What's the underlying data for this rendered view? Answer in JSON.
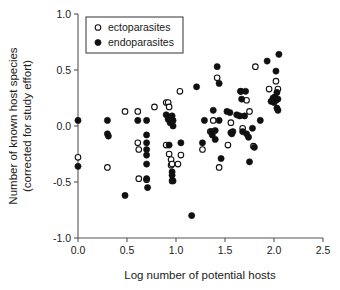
{
  "figure": {
    "background_color": "#ffffff",
    "axis_color": "#555555",
    "marker_color": "#101010"
  },
  "chart_data": {
    "type": "scatter",
    "title": "",
    "xlabel": "Log number of potential hosts",
    "ylabel": "Number of known host species (corrected for study effort)",
    "ylabel_line1": "Number of known host species",
    "ylabel_line2": "(corrected for study effort)",
    "xlim": [
      0.0,
      2.5
    ],
    "ylim": [
      -1.0,
      1.0
    ],
    "xticks": [
      "0.0",
      "0.5",
      "1.0",
      "1.5",
      "2.0",
      "2.5"
    ],
    "xtick_values": [
      0.0,
      0.5,
      1.0,
      1.5,
      2.0,
      2.5
    ],
    "yticks": [
      "1.0",
      "0.5",
      "0.0",
      "-0.5",
      "-1.0"
    ],
    "ytick_values": [
      1.0,
      0.5,
      0.0,
      -0.5,
      -1.0
    ],
    "grid": false,
    "legend_position": "top-left-inside",
    "series": [
      {
        "name": "ectoparasites",
        "marker": "open-circle",
        "marker_fill": "#ffffff",
        "marker_edge": "#101010",
        "points": [
          [
            0.0,
            -0.28
          ],
          [
            0.3,
            -0.37
          ],
          [
            0.48,
            0.13
          ],
          [
            0.61,
            0.13
          ],
          [
            0.61,
            -0.15
          ],
          [
            0.62,
            -0.21
          ],
          [
            0.62,
            -0.47
          ],
          [
            0.7,
            -0.48
          ],
          [
            0.78,
            0.17
          ],
          [
            0.9,
            0.21
          ],
          [
            0.92,
            0.21
          ],
          [
            0.93,
            0.17
          ],
          [
            0.9,
            -0.17
          ],
          [
            0.93,
            -0.25
          ],
          [
            0.95,
            -0.3
          ],
          [
            0.95,
            -0.35
          ],
          [
            0.96,
            -0.34
          ],
          [
            0.96,
            -0.49
          ],
          [
            1.02,
            -0.34
          ],
          [
            1.04,
            0.31
          ],
          [
            1.05,
            -0.26
          ],
          [
            1.27,
            -0.21
          ],
          [
            1.35,
            -0.05
          ],
          [
            1.38,
            0.05
          ],
          [
            1.42,
            0.43
          ],
          [
            1.44,
            -0.37
          ],
          [
            1.53,
            -0.17
          ],
          [
            1.56,
            0.03
          ],
          [
            1.66,
            0.31
          ],
          [
            1.68,
            -0.02
          ],
          [
            1.72,
            0.23
          ],
          [
            1.75,
            0.13
          ],
          [
            1.79,
            -0.18
          ],
          [
            1.81,
            0.53
          ],
          [
            1.95,
            0.33
          ],
          [
            2.02,
            0.4
          ],
          [
            2.04,
            0.33
          ]
        ]
      },
      {
        "name": "endoparasites",
        "marker": "filled-circle",
        "marker_fill": "#101010",
        "marker_edge": "#101010",
        "points": [
          [
            0.0,
            0.05
          ],
          [
            0.0,
            -0.36
          ],
          [
            0.3,
            0.05
          ],
          [
            0.3,
            -0.07
          ],
          [
            0.31,
            -0.09
          ],
          [
            0.48,
            -0.62
          ],
          [
            0.61,
            0.05
          ],
          [
            0.7,
            0.05
          ],
          [
            0.7,
            -0.08
          ],
          [
            0.7,
            -0.15
          ],
          [
            0.7,
            -0.21
          ],
          [
            0.7,
            -0.26
          ],
          [
            0.7,
            -0.34
          ],
          [
            0.7,
            -0.47
          ],
          [
            0.71,
            -0.55
          ],
          [
            0.9,
            0.1
          ],
          [
            0.92,
            0.06
          ],
          [
            0.93,
            0.08
          ],
          [
            0.94,
            0.03
          ],
          [
            0.95,
            0.07
          ],
          [
            0.96,
            0.09
          ],
          [
            0.97,
            0.05
          ],
          [
            0.97,
            0.0
          ],
          [
            0.93,
            -0.17
          ],
          [
            0.96,
            -0.41
          ],
          [
            0.96,
            -0.44
          ],
          [
            0.97,
            -0.49
          ],
          [
            1.05,
            -0.15
          ],
          [
            1.16,
            -0.8
          ],
          [
            1.21,
            0.35
          ],
          [
            1.27,
            -0.15
          ],
          [
            1.29,
            0.05
          ],
          [
            1.36,
            -0.05
          ],
          [
            1.37,
            -0.08
          ],
          [
            1.38,
            0.14
          ],
          [
            1.4,
            -0.04
          ],
          [
            1.4,
            -0.12
          ],
          [
            1.42,
            0.53
          ],
          [
            1.44,
            0.38
          ],
          [
            1.44,
            0.05
          ],
          [
            1.46,
            -0.29
          ],
          [
            1.52,
            0.13
          ],
          [
            1.55,
            0.12
          ],
          [
            1.56,
            -0.06
          ],
          [
            1.57,
            -0.07
          ],
          [
            1.58,
            -0.05
          ],
          [
            1.62,
            0.1
          ],
          [
            1.65,
            0.09
          ],
          [
            1.66,
            0.31
          ],
          [
            1.67,
            0.24
          ],
          [
            1.68,
            -0.05
          ],
          [
            1.7,
            0.09
          ],
          [
            1.71,
            0.31
          ],
          [
            1.72,
            -0.07
          ],
          [
            1.74,
            -0.1
          ],
          [
            1.75,
            -0.32
          ],
          [
            1.78,
            -0.02
          ],
          [
            1.8,
            -0.19
          ],
          [
            1.86,
            0.05
          ],
          [
            1.93,
            0.58
          ],
          [
            1.97,
            0.22
          ],
          [
            1.99,
            0.25
          ],
          [
            2.0,
            0.21
          ],
          [
            2.01,
            0.26
          ],
          [
            2.02,
            0.23
          ],
          [
            2.02,
            0.49
          ],
          [
            2.03,
            0.3
          ],
          [
            2.03,
            0.16
          ],
          [
            2.04,
            0.14
          ],
          [
            2.04,
            0.24
          ],
          [
            2.05,
            0.64
          ]
        ]
      }
    ],
    "legend": [
      {
        "label": "ectoparasites",
        "marker": "open-circle"
      },
      {
        "label": "endoparasites",
        "marker": "filled-circle"
      }
    ]
  }
}
